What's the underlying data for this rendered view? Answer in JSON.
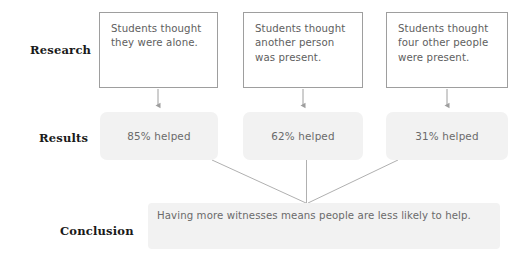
{
  "diagram": {
    "type": "flowchart",
    "background_color": "#ffffff",
    "rows": [
      {
        "id": "research",
        "label": "Research"
      },
      {
        "id": "results",
        "label": "Results"
      },
      {
        "id": "conclusion",
        "label": "Conclusion"
      }
    ],
    "research_boxes": [
      {
        "text": "Students thought they were alone."
      },
      {
        "text": "Students thought another person was present."
      },
      {
        "text": "Students thought four other people were present."
      }
    ],
    "results_boxes": [
      {
        "text": "85% helped"
      },
      {
        "text": "62% helped"
      },
      {
        "text": "31% helped"
      }
    ],
    "conclusion": {
      "text": "Having more witnesses means people are less likely to help."
    },
    "colors": {
      "box_border": "#9e9e9e",
      "box_fill": "#ffffff",
      "soft_fill": "#f2f2f2",
      "body_text": "#6a6a6a",
      "label_text": "#1a1a1a",
      "connector": "#9e9e9e"
    },
    "connectors": {
      "down_arrows": [
        {
          "from": "research-box-1",
          "to": "results-box-1",
          "x": 158
        },
        {
          "from": "research-box-2",
          "to": "results-box-2",
          "x": 303
        },
        {
          "from": "research-box-3",
          "to": "results-box-3",
          "x": 447
        }
      ],
      "converging_lines": [
        {
          "from": "results-box-1",
          "to": "conclusion-box"
        },
        {
          "from": "results-box-2",
          "to": "conclusion-box"
        },
        {
          "from": "results-box-3",
          "to": "conclusion-box"
        }
      ],
      "convergence_point": {
        "x": 307,
        "y": 203
      }
    }
  }
}
